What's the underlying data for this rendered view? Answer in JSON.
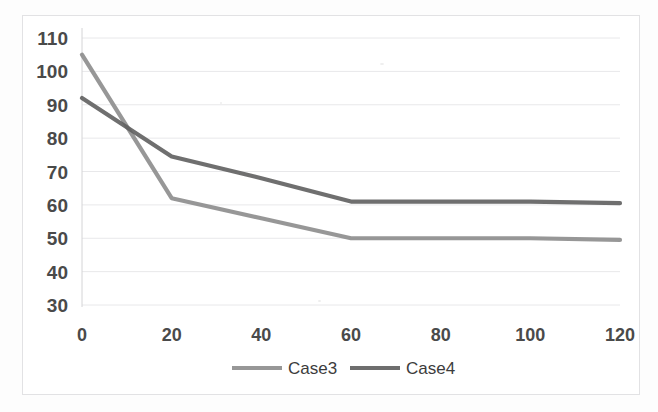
{
  "chart_data": {
    "type": "line",
    "title": "",
    "subtitle": "",
    "xlabel": "",
    "ylabel": "",
    "x": [
      0,
      20,
      40,
      60,
      80,
      100,
      120
    ],
    "xticklabels": [
      "0",
      "20",
      "40",
      "60",
      "80",
      "100",
      "120"
    ],
    "yticklabels": [
      "110",
      "100",
      "90",
      "80",
      "70",
      "60",
      "50",
      "40",
      "30"
    ],
    "yticks": [
      110,
      100,
      90,
      80,
      70,
      60,
      50,
      40,
      30
    ],
    "ylim": [
      30,
      110
    ],
    "xlim": [
      0,
      120
    ],
    "grid": "horizontal",
    "legend_position": "bottom-center",
    "series": [
      {
        "name": "Case3",
        "color": "#8c8c8c",
        "values": [
          105,
          62,
          56,
          50,
          50,
          50,
          49.5
        ]
      },
      {
        "name": "Case4",
        "color": "#5f5f5f",
        "values": [
          92,
          74.5,
          68,
          61,
          61,
          61,
          60.5
        ]
      }
    ]
  },
  "style": {
    "axis_text_color": "#4a4a4a",
    "gridline_color": "#e8e8ea",
    "axis_line_color": "#d4d4d6",
    "plot_background": "#ffffff",
    "frame_border": "#e2e2e4"
  },
  "legend": {
    "entries": [
      {
        "label": "Case3",
        "swatch_color": "#8c8c8c"
      },
      {
        "label": "Case4",
        "swatch_color": "#5f5f5f"
      }
    ]
  }
}
